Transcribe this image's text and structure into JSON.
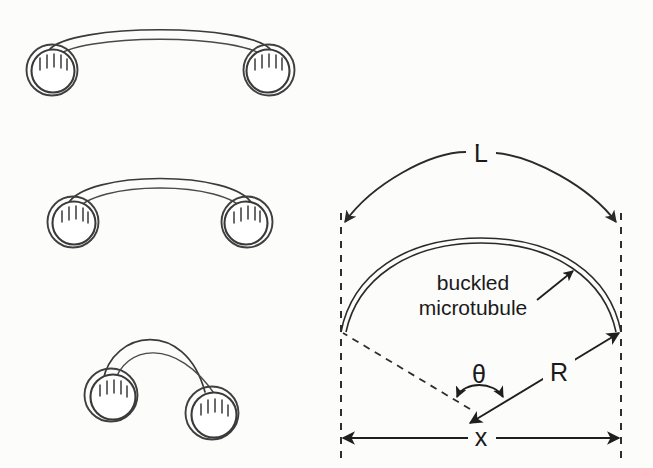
{
  "figure": {
    "background_color": "#fcfcfb",
    "ink_color": "#2a2a2a",
    "width": 653,
    "height": 468
  },
  "left_panels": {
    "description": "Three stages of a microtubule buckling between two beads",
    "panels": [
      {
        "id": "panel-1",
        "stage_label": "shallow buckle",
        "bead_left": {
          "cx": 52,
          "cy": 70,
          "r": 23
        },
        "bead_right": {
          "cx": 268,
          "cy": 70,
          "r": 23
        },
        "arc_apex": {
          "x": 160,
          "y": 34
        },
        "separation": 216
      },
      {
        "id": "panel-2",
        "stage_label": "medium buckle",
        "bead_left": {
          "cx": 74,
          "cy": 222,
          "r": 23
        },
        "bead_right": {
          "cx": 246,
          "cy": 222,
          "r": 23
        },
        "arc_apex": {
          "x": 160,
          "y": 178
        },
        "separation": 172
      },
      {
        "id": "panel-3",
        "stage_label": "deep buckle",
        "bead_left": {
          "cx": 112,
          "cy": 396,
          "r": 24
        },
        "bead_right": {
          "cx": 214,
          "cy": 414,
          "r": 24
        },
        "arc_apex": {
          "x": 172,
          "y": 331
        },
        "separation": 104
      }
    ],
    "bead": {
      "name": "bead",
      "tick_count": 5,
      "double_ring": true
    }
  },
  "right_panel": {
    "description": "Geometry of a buckled microtubule: arc length L, chord x, radius R, subtended angle theta",
    "labels": {
      "arc_length": "L",
      "chord": "x",
      "radius": "R",
      "angle": "θ",
      "annotation_line1": "buckled",
      "annotation_line2": "microtubule"
    },
    "geometry": {
      "left_guide_x": 341,
      "right_guide_x": 621,
      "guide_top_y": 213,
      "guide_bottom_y": 462,
      "chord_y": 438,
      "arc_L_apex_y": 152,
      "tube_apex_y": 238,
      "endpoint_y": 332,
      "center": {
        "x": 479,
        "y": 414
      },
      "chord_length_px": 280
    }
  }
}
